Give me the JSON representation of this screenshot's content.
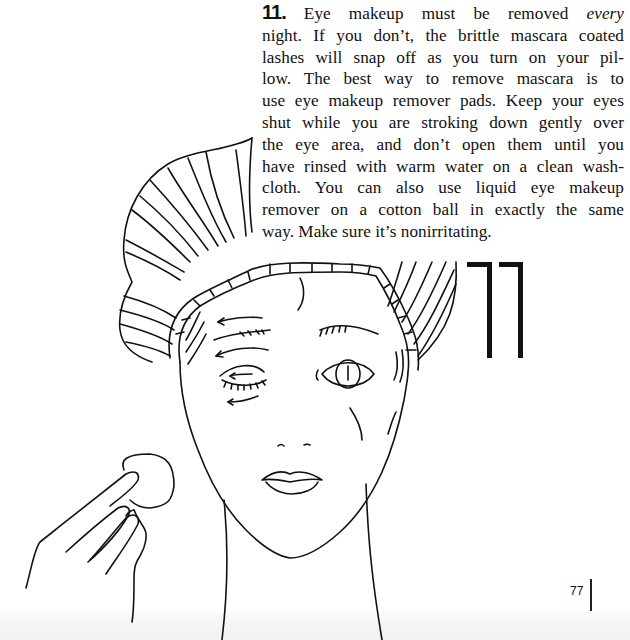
{
  "tip": {
    "number": "11.",
    "lines": [
      {
        "before": " Eye makeup must be removed ",
        "emphasis": "every",
        "after": ""
      },
      {
        "text": "night. If you don’t, the brittle mascara coated"
      },
      {
        "text": "lashes will snap off as you turn on your pil-"
      },
      {
        "text": "low. The best way to remove mascara is to"
      },
      {
        "text": "use eye makeup remover pads. Keep your eyes"
      },
      {
        "text": "shut while you are stroking down gently over"
      },
      {
        "text": "the eye area, and don’t open them until you"
      },
      {
        "text": "have rinsed with warm water on a clean wash-"
      },
      {
        "text": "cloth. You can also use liquid eye makeup"
      },
      {
        "text": "remover on a cotton ball in exactly the same"
      },
      {
        "text": "way. Make sure it’s nonirritating."
      }
    ]
  },
  "large_number": "77",
  "page_number": "77",
  "illustration": {
    "subject": "woman in shower cap removing eye makeup with cotton pad",
    "elements": [
      "shower-cap",
      "face",
      "closed-eye-with-arrows",
      "open-eye",
      "lips",
      "neck",
      "hand",
      "cotton-pad"
    ]
  }
}
